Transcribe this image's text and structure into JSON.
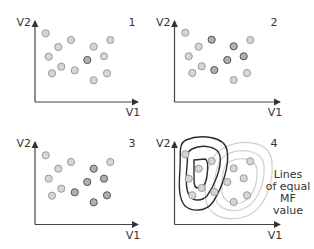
{
  "panels": [
    {
      "id": "1",
      "label": "1",
      "x_axis": "V1",
      "y_axis": "V2",
      "origin": [
        35,
        102
      ],
      "x_end": 138,
      "y_end": 21,
      "points": [
        {
          "x": 45.7,
          "y": 33.3,
          "shade": "light"
        },
        {
          "x": 71,
          "y": 40,
          "shade": "light"
        },
        {
          "x": 58.3,
          "y": 47,
          "shade": "light"
        },
        {
          "x": 110.3,
          "y": 40,
          "shade": "light"
        },
        {
          "x": 93.7,
          "y": 46.7,
          "shade": "light"
        },
        {
          "x": 48.7,
          "y": 56.7,
          "shade": "light"
        },
        {
          "x": 104,
          "y": 56.3,
          "shade": "light"
        },
        {
          "x": 87.3,
          "y": 60,
          "shade": "dark"
        },
        {
          "x": 61.3,
          "y": 66.7,
          "shade": "light"
        },
        {
          "x": 74.7,
          "y": 70.3,
          "shade": "light"
        },
        {
          "x": 52,
          "y": 73.3,
          "shade": "light"
        },
        {
          "x": 107,
          "y": 73.3,
          "shade": "light"
        },
        {
          "x": 93.7,
          "y": 80.3,
          "shade": "light"
        }
      ]
    },
    {
      "id": "2",
      "label": "2",
      "x_axis": "V1",
      "y_axis": "V2",
      "origin": [
        174.5,
        102
      ],
      "x_end": 280,
      "y_end": 21,
      "points": [
        {
          "x": 185.3,
          "y": 32.7,
          "shade": "light"
        },
        {
          "x": 211.7,
          "y": 39.7,
          "shade": "dark"
        },
        {
          "x": 250.3,
          "y": 40,
          "shade": "light"
        },
        {
          "x": 198.7,
          "y": 46.7,
          "shade": "light"
        },
        {
          "x": 233.7,
          "y": 46.3,
          "shade": "dark"
        },
        {
          "x": 188.7,
          "y": 56.3,
          "shade": "light"
        },
        {
          "x": 243.7,
          "y": 56.3,
          "shade": "dark"
        },
        {
          "x": 227.3,
          "y": 60,
          "shade": "dark"
        },
        {
          "x": 201.7,
          "y": 66.3,
          "shade": "light"
        },
        {
          "x": 214.3,
          "y": 70,
          "shade": "dark"
        },
        {
          "x": 192.3,
          "y": 73,
          "shade": "light"
        },
        {
          "x": 247,
          "y": 73,
          "shade": "light"
        },
        {
          "x": 233.7,
          "y": 80,
          "shade": "light"
        }
      ]
    },
    {
      "id": "3",
      "label": "3",
      "x_axis": "V1",
      "y_axis": "V2",
      "origin": [
        35,
        224.5
      ],
      "x_end": 138,
      "y_end": 142,
      "points": [
        {
          "x": 45.7,
          "y": 155.3,
          "shade": "light"
        },
        {
          "x": 71,
          "y": 162,
          "shade": "light"
        },
        {
          "x": 58.3,
          "y": 168.7,
          "shade": "light"
        },
        {
          "x": 110.3,
          "y": 162,
          "shade": "light"
        },
        {
          "x": 93.7,
          "y": 168.7,
          "shade": "dark"
        },
        {
          "x": 48.7,
          "y": 178.7,
          "shade": "light"
        },
        {
          "x": 104,
          "y": 178.7,
          "shade": "dark"
        },
        {
          "x": 87.3,
          "y": 182,
          "shade": "dark"
        },
        {
          "x": 61.3,
          "y": 188.7,
          "shade": "light"
        },
        {
          "x": 74.7,
          "y": 192.3,
          "shade": "dark"
        },
        {
          "x": 52,
          "y": 195.7,
          "shade": "light"
        },
        {
          "x": 107,
          "y": 195.3,
          "shade": "dark"
        },
        {
          "x": 93.7,
          "y": 202.3,
          "shade": "dark"
        }
      ]
    },
    {
      "id": "4",
      "label": "4",
      "x_axis": "V1",
      "y_axis": "V2",
      "origin": [
        174.5,
        224.5
      ],
      "x_end": 280,
      "y_end": 142,
      "points": [
        {
          "x": 185.3,
          "y": 154.3,
          "shade": "light"
        },
        {
          "x": 211.7,
          "y": 161,
          "shade": "light"
        },
        {
          "x": 198.7,
          "y": 168.7,
          "shade": "light"
        },
        {
          "x": 250.3,
          "y": 161.3,
          "shade": "light"
        },
        {
          "x": 233.7,
          "y": 168.3,
          "shade": "light"
        },
        {
          "x": 188.7,
          "y": 178.7,
          "shade": "light"
        },
        {
          "x": 243.7,
          "y": 178.3,
          "shade": "light"
        },
        {
          "x": 227.3,
          "y": 182,
          "shade": "light"
        },
        {
          "x": 201.7,
          "y": 188,
          "shade": "light"
        },
        {
          "x": 214.3,
          "y": 192,
          "shade": "light"
        },
        {
          "x": 192.3,
          "y": 195.3,
          "shade": "light"
        },
        {
          "x": 247,
          "y": 195.3,
          "shade": "light"
        },
        {
          "x": 233.7,
          "y": 202,
          "shade": "light"
        }
      ],
      "annotation": [
        "Lines",
        "of equal",
        "MF",
        "value"
      ]
    }
  ],
  "colors": {
    "axis": "#444444",
    "point_light_fill": "#d6d6d6",
    "point_light_stroke": "#9a9a9a",
    "point_dark_fill": "#b0b0b0",
    "point_dark_stroke": "#555555",
    "contour_dark": "#2b2b2b",
    "contour_light": "#c8c8c8"
  }
}
